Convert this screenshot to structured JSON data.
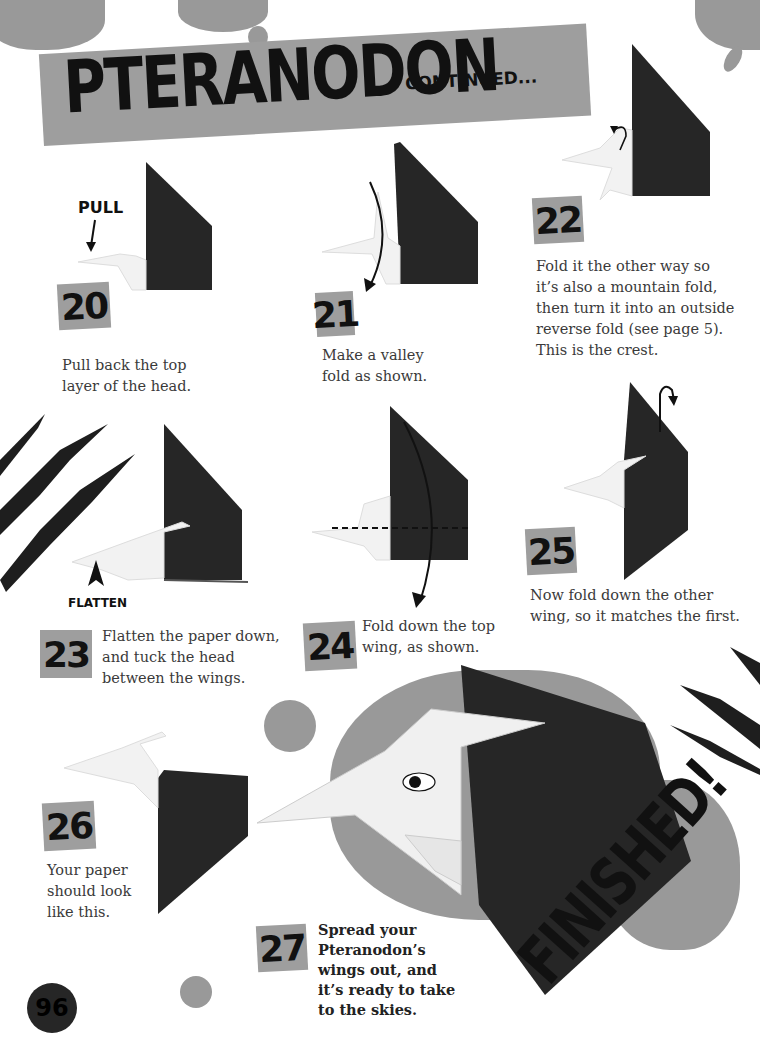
{
  "header": {
    "title": "PTERANODON",
    "subtitle": "CONTINUED..."
  },
  "colors": {
    "banner_gray": "#9e9e9e",
    "paper_black": "#262626",
    "paper_white": "#f2f2f2",
    "splatter_gray": "#999999",
    "text": "#3a3a3a"
  },
  "steps": [
    {
      "number": "20",
      "caption": "Pull back the top layer of the head.",
      "lines": [
        "Pull back the top",
        "layer of the head."
      ],
      "label": "PULL",
      "icons": [
        "arrow-down-icon"
      ]
    },
    {
      "number": "21",
      "caption": "Make a valley fold as shown.",
      "lines": [
        "Make a valley",
        "fold as shown."
      ],
      "icons": [
        "curved-arrow-icon",
        "valley-fold-line"
      ]
    },
    {
      "number": "22",
      "caption": "Fold it the other way so it's also a mountain fold, then turn it into an outside reverse fold (see page 5). This is the crest.",
      "lines": [
        "Fold it the other way so",
        "it’s also a mountain fold,",
        "then turn it into an outside",
        "reverse fold (see page 5).",
        "This is the crest."
      ],
      "icons": [
        "mountain-fold-arrow-icon"
      ]
    },
    {
      "number": "23",
      "caption": "Flatten the paper down, and tuck the head between the wings.",
      "lines": [
        "Flatten the paper down,",
        "and tuck the head",
        "between the wings."
      ],
      "label": "FLATTEN",
      "icons": [
        "arrow-up-icon"
      ]
    },
    {
      "number": "24",
      "caption": "Fold down the top wing, as shown.",
      "lines": [
        "Fold down the top",
        "wing, as shown."
      ],
      "icons": [
        "curved-arrow-down-icon",
        "fold-line-dashed"
      ]
    },
    {
      "number": "25",
      "caption": "Now fold down the other wing, so it matches the first.",
      "lines": [
        "Now fold down the other",
        "wing, so it matches the first."
      ],
      "icons": [
        "fold-behind-arrow-icon"
      ]
    },
    {
      "number": "26",
      "caption": "Your paper should look like this.",
      "lines": [
        "Your paper",
        "should look",
        "like this."
      ]
    },
    {
      "number": "27",
      "caption": "Spread your Pteranodon's wings out, and it's ready to take to the skies.",
      "lines": [
        "Spread your",
        "Pteranodon’s",
        "wings out, and",
        "it’s ready to take",
        "to the skies."
      ]
    }
  ],
  "finished_label": "FINISHED!",
  "page_number": "96"
}
